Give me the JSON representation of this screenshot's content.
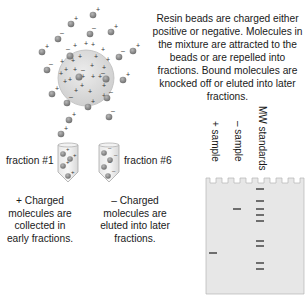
{
  "description": "Resin beads are charged either positive or negative. Molecules in the mixture are attracted to the beads or are repelled into fractions. Bound molecules are knocked off or eluted into later fractions.",
  "fractions": [
    {
      "label": "fraction #1",
      "caption": "+ Charged molecules are collected in early fractions.",
      "charge": "+"
    },
    {
      "label": "fraction #6",
      "caption": "– Charged molecules are eluted into later fractions.",
      "charge": "–"
    }
  ],
  "gel": {
    "lanes": [
      "+ sample",
      "– sample",
      "MW standards"
    ],
    "lane_count": 7
  },
  "colors": {
    "bead_fill": "#d9d9d9",
    "molecule": "#8a8a8a",
    "gel_fill": "#e6e6e6",
    "band": "#6e6e6e"
  }
}
